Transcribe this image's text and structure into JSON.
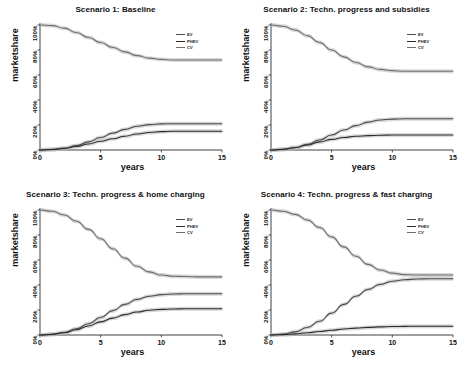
{
  "figure": {
    "ylabel": "marketshare",
    "xlabel": "years",
    "yticks": [
      "0%",
      "20%",
      "40%",
      "60%",
      "80%",
      "100%"
    ],
    "xticks": [
      "0",
      "5",
      "10",
      "15"
    ],
    "colors": {
      "EV": "#4a4a4a",
      "PHEV": "#2b2b2b",
      "CV": "#6e6e6e",
      "band": "#b8b8b8",
      "axis": "#2a2a2a"
    }
  },
  "panels": [
    {
      "id": "scenario-1",
      "title": "Scenario 1: Baseline",
      "legend": [
        "EV",
        "PHEV",
        "CV"
      ]
    },
    {
      "id": "scenario-2",
      "title": "Scenario 2: Techn. progress and subsidies",
      "legend": [
        "EV",
        "PHEV",
        "CV"
      ]
    },
    {
      "id": "scenario-3",
      "title": "Scenario 3: Techn. progress & home charging",
      "legend": [
        "EV",
        "PHEV",
        "CV"
      ]
    },
    {
      "id": "scenario-4",
      "title": "Scenario 4: Techn. progress & fast charging",
      "legend": [
        "EV",
        "PHEV",
        "CV"
      ]
    }
  ],
  "chart_data": {
    "type": "line",
    "xlabel": "years",
    "ylabel": "marketshare",
    "xlim": [
      0,
      15
    ],
    "ylim": [
      0,
      100
    ],
    "xticks": [
      0,
      5,
      10,
      15
    ],
    "yticks": [
      0,
      20,
      40,
      60,
      80,
      100
    ],
    "ytick_labels": [
      "0%",
      "20%",
      "40%",
      "60%",
      "80%",
      "100%"
    ],
    "grid": false,
    "legend_position": "top-right",
    "legend_entries": [
      "EV",
      "PHEV",
      "CV"
    ],
    "x": [
      0,
      1,
      2,
      3,
      4,
      5,
      6,
      7,
      8,
      9,
      10,
      11,
      12,
      13,
      14,
      15
    ],
    "panels": [
      {
        "title": "Scenario 1: Baseline",
        "series": [
          {
            "name": "CV",
            "values": [
              100,
              99.5,
              97.5,
              94,
              90,
              86,
              82,
              78.5,
              75.5,
              73.5,
              72.5,
              72,
              72,
              72,
              72,
              72
            ]
          },
          {
            "name": "EV",
            "values": [
              0,
              0.5,
              1.5,
              3.5,
              6.5,
              10,
              13.5,
              16.5,
              19,
              20.3,
              20.9,
              21,
              21,
              21,
              21,
              21
            ]
          },
          {
            "name": "PHEV",
            "values": [
              0,
              0.4,
              1.2,
              2.8,
              4.8,
              7,
              9,
              11,
              12.8,
              14,
              14.7,
              15,
              15,
              15,
              15,
              15
            ]
          }
        ]
      },
      {
        "title": "Scenario 2: Techn. progress and subsidies",
        "series": [
          {
            "name": "CV",
            "values": [
              100,
              99,
              96,
              91.5,
              86,
              80,
              74.5,
              70,
              66.5,
              64.5,
              63.5,
              63,
              63,
              63,
              63,
              63
            ]
          },
          {
            "name": "EV",
            "values": [
              0,
              0.6,
              2,
              4.5,
              8,
              12,
              16,
              19.5,
              22.3,
              24,
              24.7,
              25,
              25,
              25,
              25,
              25
            ]
          },
          {
            "name": "PHEV",
            "values": [
              0,
              0.5,
              1.8,
              4,
              6.5,
              8.5,
              10,
              11,
              11.5,
              11.8,
              12,
              12,
              12,
              12,
              12,
              12
            ]
          }
        ]
      },
      {
        "title": "Scenario 3: Techn. progress & home charging",
        "series": [
          {
            "name": "CV",
            "values": [
              100,
              99,
              96,
              91,
              84.5,
              77,
              69,
              61.5,
              55,
              50.5,
              48,
              47,
              46.8,
              46.5,
              46.5,
              46.5
            ]
          },
          {
            "name": "EV",
            "values": [
              0,
              0.6,
              2,
              5,
              9,
              14,
              19.5,
              24.5,
              28.5,
              31,
              32.3,
              32.8,
              33,
              33,
              33,
              33
            ]
          },
          {
            "name": "PHEV",
            "values": [
              0,
              0.5,
              1.8,
              4.2,
              7.2,
              10.5,
              13.5,
              16.3,
              18.4,
              19.8,
              20.5,
              20.8,
              21,
              21,
              21,
              21
            ]
          }
        ]
      },
      {
        "title": "Scenario 4: Techn. progress & fast charging",
        "series": [
          {
            "name": "CV",
            "values": [
              100,
              99,
              96.5,
              92,
              86,
              78.5,
              70.5,
              63,
              56.5,
              52,
              49.5,
              48.3,
              48,
              48,
              48,
              48
            ]
          },
          {
            "name": "EV",
            "values": [
              0,
              0.7,
              2.5,
              6,
              11,
              17.5,
              24.5,
              31,
              36.5,
              40.5,
              43,
              44.2,
              44.8,
              45,
              45,
              45
            ]
          },
          {
            "name": "PHEV",
            "values": [
              0,
              0.3,
              0.9,
              1.8,
              2.8,
              3.8,
              4.8,
              5.5,
              6.1,
              6.5,
              6.8,
              6.9,
              7,
              7,
              7,
              7
            ]
          }
        ]
      }
    ]
  }
}
